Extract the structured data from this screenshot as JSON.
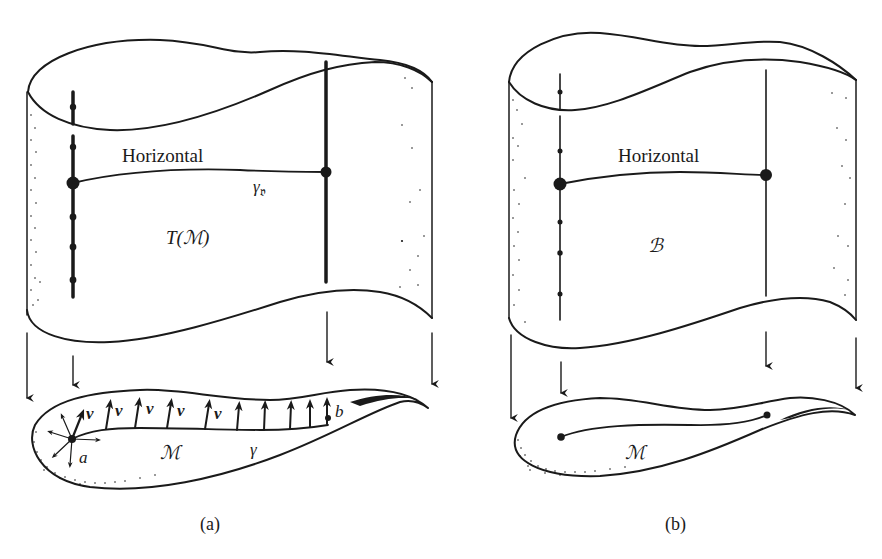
{
  "figure": {
    "panels": [
      {
        "id": "a",
        "caption": "(a)",
        "bundle_label": "T(ℳ)",
        "horizontal_label": "Horizontal",
        "curve_label": "γᵥ",
        "curve_label_main": "γ",
        "curve_label_sub": "𝔳",
        "base_label": "ℳ",
        "base_curve_label": "γ",
        "start_point_label": "a",
        "end_point_label": "b",
        "vector_label": "v",
        "vector_labels_count": 5
      },
      {
        "id": "b",
        "caption": "(b)",
        "bundle_label": "ℬ",
        "horizontal_label": "Horizontal",
        "base_label": "ℳ"
      }
    ]
  },
  "colors": {
    "ink": "#1a1a1a",
    "paper": "#ffffff"
  }
}
